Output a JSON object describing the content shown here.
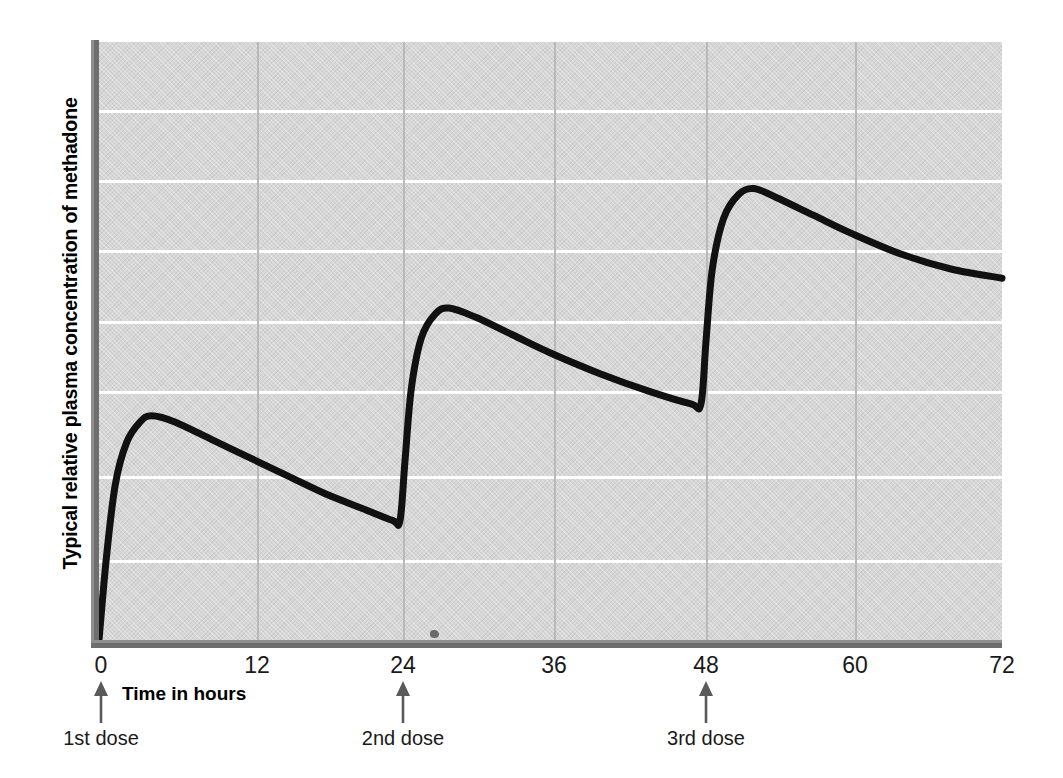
{
  "chart_data": {
    "type": "line",
    "title": "",
    "subtitle": "",
    "xlabel": "Time in hours",
    "ylabel": "Typical relative plasma concentration of methadone",
    "xlim": [
      0,
      72
    ],
    "ylim": [
      0,
      100
    ],
    "xticks": [
      "0",
      "12",
      "24",
      "36",
      "48",
      "60",
      "72"
    ],
    "xtick_values": [
      0,
      12,
      24,
      36,
      48,
      60,
      72
    ],
    "yticks": [],
    "grid": "horizontal and vertical gridlines shown; horizontal white, vertical light grey",
    "legend": "none",
    "plot_background": "#d6d6d6",
    "line_color": "#111111",
    "series": [
      {
        "name": "Plasma methadone concentration",
        "points": [
          {
            "t": 0.0,
            "c": 0
          },
          {
            "t": 0.6,
            "c": 14
          },
          {
            "t": 1.3,
            "c": 26
          },
          {
            "t": 2.2,
            "c": 33
          },
          {
            "t": 3.3,
            "c": 36.5
          },
          {
            "t": 4.2,
            "c": 37.5
          },
          {
            "t": 6.0,
            "c": 36.5
          },
          {
            "t": 9.0,
            "c": 33.5
          },
          {
            "t": 12.0,
            "c": 30.5
          },
          {
            "t": 15.0,
            "c": 27.5
          },
          {
            "t": 18.0,
            "c": 24.5
          },
          {
            "t": 21.0,
            "c": 22.0
          },
          {
            "t": 23.4,
            "c": 20.0
          },
          {
            "t": 24.0,
            "c": 20.0
          },
          {
            "t": 24.4,
            "c": 30.0
          },
          {
            "t": 24.9,
            "c": 42.0
          },
          {
            "t": 25.7,
            "c": 50.5
          },
          {
            "t": 26.8,
            "c": 54.5
          },
          {
            "t": 27.9,
            "c": 55.5
          },
          {
            "t": 30.0,
            "c": 54.0
          },
          {
            "t": 33.0,
            "c": 51.0
          },
          {
            "t": 36.0,
            "c": 48.0
          },
          {
            "t": 40.0,
            "c": 44.5
          },
          {
            "t": 44.0,
            "c": 41.5
          },
          {
            "t": 47.2,
            "c": 39.5
          },
          {
            "t": 48.0,
            "c": 39.5
          },
          {
            "t": 48.4,
            "c": 50.0
          },
          {
            "t": 48.9,
            "c": 62.0
          },
          {
            "t": 49.8,
            "c": 70.5
          },
          {
            "t": 51.0,
            "c": 74.5
          },
          {
            "t": 52.2,
            "c": 75.5
          },
          {
            "t": 54.0,
            "c": 74.0
          },
          {
            "t": 57.0,
            "c": 71.0
          },
          {
            "t": 60.0,
            "c": 68.0
          },
          {
            "t": 64.0,
            "c": 64.5
          },
          {
            "t": 68.0,
            "c": 62.0
          },
          {
            "t": 72.0,
            "c": 60.5
          }
        ],
        "annotations": [
          {
            "t": 4.2,
            "kind": "peak",
            "label": "1st dose peak"
          },
          {
            "t": 24.0,
            "kind": "trough",
            "label": "1st dose trough"
          },
          {
            "t": 27.9,
            "kind": "peak",
            "label": "2nd dose peak"
          },
          {
            "t": 48.0,
            "kind": "trough",
            "label": "2nd dose trough"
          },
          {
            "t": 52.2,
            "kind": "peak",
            "label": "3rd dose peak"
          }
        ]
      }
    ],
    "gridlines_y": [
      90,
      78,
      66.5,
      55,
      43.5,
      29.5,
      15.5
    ],
    "gridlines_x": [
      12,
      24,
      36,
      48,
      60
    ],
    "doses": [
      {
        "label": "1st dose",
        "t": 0
      },
      {
        "label": "2nd dose",
        "t": 24
      },
      {
        "label": "3rd dose",
        "t": 48
      }
    ]
  },
  "axis": {
    "x_title": "Time in hours",
    "y_title": "Typical relative plasma concentration of methadone",
    "x_tick_labels": [
      "0",
      "12",
      "24",
      "36",
      "48",
      "60",
      "72"
    ]
  },
  "doses": {
    "items": [
      {
        "label": "1st dose"
      },
      {
        "label": "2nd dose"
      },
      {
        "label": "3rd dose"
      }
    ]
  },
  "colors": {
    "plot_background": "#d6d6d6",
    "gridline_horizontal": "#ffffff",
    "gridline_vertical": "#b9b9b9",
    "axis_spine": "#6e6e6e",
    "curve": "#111111",
    "text": "#1a1a1a"
  }
}
